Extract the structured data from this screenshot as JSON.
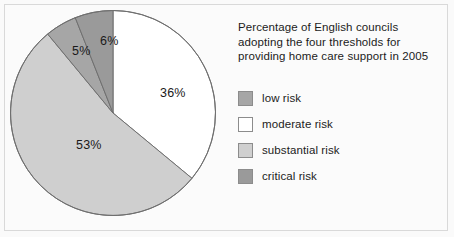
{
  "chart_data": {
    "type": "pie",
    "title": "Percentage of English councils adopting the four thresholds for providing home care support in 2005",
    "title_lines": [
      "Percentage of English councils",
      "adopting the four thresholds for",
      "providing home care support in 2005"
    ],
    "categories": [
      "low risk",
      "moderate risk",
      "substantial risk",
      "critical risk"
    ],
    "values": [
      5,
      36,
      53,
      6
    ],
    "value_labels": [
      "5%",
      "36%",
      "53%",
      "6%"
    ],
    "colors": [
      "#a6a6a6",
      "#ffffff",
      "#cfcfcf",
      "#9a9a9a"
    ],
    "slice_order_clockwise_from_top": [
      "moderate risk",
      "substantial risk",
      "low risk",
      "critical risk"
    ],
    "legend_position": "right",
    "grid": false,
    "xlabel": "",
    "ylabel": ""
  },
  "pie": {
    "slices": [
      {
        "label": "moderate risk",
        "value": 36,
        "value_label": "36%",
        "color": "#ffffff",
        "start_pct": 0,
        "end_pct": 36
      },
      {
        "label": "substantial risk",
        "value": 53,
        "value_label": "53%",
        "color": "#cfcfcf",
        "start_pct": 36,
        "end_pct": 89
      },
      {
        "label": "low risk",
        "value": 5,
        "value_label": "5%",
        "color": "#a6a6a6",
        "start_pct": 89,
        "end_pct": 94
      },
      {
        "label": "critical risk",
        "value": 6,
        "value_label": "6%",
        "color": "#9a9a9a",
        "start_pct": 94,
        "end_pct": 100
      }
    ],
    "labels": {
      "moderate": "36%",
      "substantial": "53%",
      "low": "5%",
      "critical": "6%"
    },
    "stroke_color": "#6f6f6f"
  },
  "title": {
    "line1": "Percentage of English councils",
    "line2": "adopting the four thresholds for",
    "line3": "providing home care support in 2005"
  },
  "legend": {
    "items": [
      {
        "label": "low risk",
        "color": "#a6a6a6"
      },
      {
        "label": "moderate risk",
        "color": "#ffffff"
      },
      {
        "label": "substantial risk",
        "color": "#cfcfcf"
      },
      {
        "label": "critical risk",
        "color": "#9a9a9a"
      }
    ]
  }
}
